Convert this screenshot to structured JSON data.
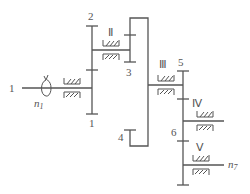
{
  "diagram": {
    "type": "gear-train-schematic",
    "colors": {
      "line": "#555555",
      "background": "#ffffff"
    },
    "input": {
      "shaft_label": "1",
      "speed_label": "n",
      "speed_sub": "1"
    },
    "output": {
      "speed_label": "n",
      "speed_sub": "7"
    },
    "shafts": [
      {
        "id": "I",
        "roman": ""
      },
      {
        "id": "II",
        "roman": "Ⅱ"
      },
      {
        "id": "III",
        "roman": "Ⅲ"
      },
      {
        "id": "IV",
        "roman": "Ⅳ"
      },
      {
        "id": "V",
        "roman": "Ⅴ"
      }
    ],
    "gears": [
      {
        "label": "1"
      },
      {
        "label": "2"
      },
      {
        "label": "3"
      },
      {
        "label": "4"
      },
      {
        "label": "5"
      },
      {
        "label": "6"
      }
    ]
  }
}
